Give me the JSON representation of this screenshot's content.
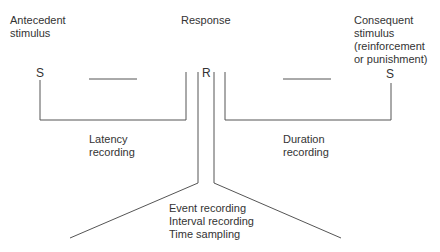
{
  "labels": {
    "antecedent": "Antecedent\nstimulus",
    "response": "Response",
    "consequent": "Consequent\nstimulus\n(reinforcement\nor punishment)",
    "s_left": "S",
    "r_mid": "R",
    "s_right": "S",
    "latency": "Latency\nrecording",
    "duration": "Duration\nrecording",
    "event_methods": "Event recording\nInterval recording\nTime sampling"
  },
  "colors": {
    "line": "#555555",
    "text": "#333333",
    "background": "#ffffff"
  }
}
